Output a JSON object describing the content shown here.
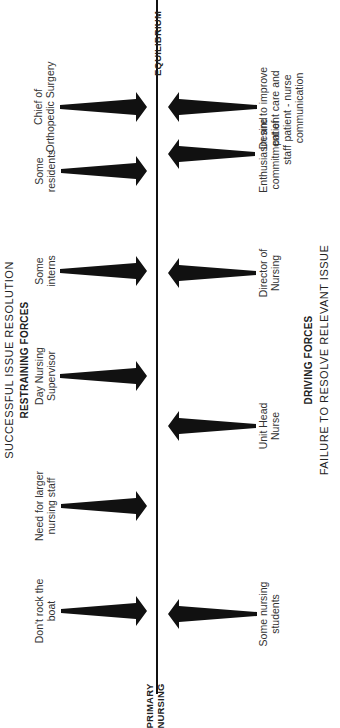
{
  "diagram": {
    "type": "force-field analysis",
    "orientation": "rotated -90deg",
    "top_heading": "SUCCESSFUL ISSUE RESOLUTION",
    "restraining_heading": "RESTRAINING FORCES",
    "driving_heading": "DRIVING FORCES",
    "bottom_heading": "FAILURE TO RESOLVE RELEVANT ISSUE",
    "line_start_label": [
      "PRIMARY",
      "NURSING"
    ],
    "line_end_label": "EQUILIBRIUM",
    "restraining_forces": [
      {
        "label": [
          "Chief of",
          "Orthopedic Surgery"
        ]
      },
      {
        "label": [
          "Some",
          "residents"
        ]
      },
      {
        "label": [
          "Some",
          "interns"
        ]
      },
      {
        "label": [
          "Day Nursing",
          "Supervisor"
        ]
      },
      {
        "label": [
          "Need for larger",
          "nursing staff"
        ]
      },
      {
        "label": [
          "Don't rock the",
          "boat"
        ]
      }
    ],
    "driving_forces": [
      {
        "label": [
          "Desire to improve",
          "patient care and",
          "patient - nurse",
          "communication"
        ]
      },
      {
        "label": [
          "Enthusiasm and",
          "commitment of",
          "staff"
        ]
      },
      {
        "label": [
          "Director of",
          "Nursing"
        ]
      },
      {
        "label": [
          "Unit Head",
          "Nurse"
        ]
      },
      {
        "label": [
          "Some nursing",
          "students"
        ]
      }
    ],
    "colors": {
      "arrow": "#111111",
      "line": "#111111",
      "text": "#333333"
    }
  }
}
